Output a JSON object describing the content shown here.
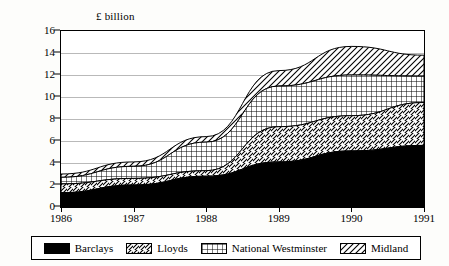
{
  "chart_data": {
    "type": "area",
    "title": "",
    "subtitle": "",
    "xlabel": "",
    "ylabel": "£ billion",
    "stacked": true,
    "grid": true,
    "legend_position": "bottom",
    "x": [
      1986,
      1987,
      1988,
      1989,
      1990,
      1991
    ],
    "categories": [
      "1986",
      "1987",
      "1988",
      "1989",
      "1990",
      "1991"
    ],
    "xtick_labels": [
      "1986",
      "1987",
      "1988",
      "1989",
      "1990",
      "1991"
    ],
    "ytick_labels": [
      "0",
      "2",
      "4",
      "6",
      "8",
      "10",
      "12",
      "14",
      "16"
    ],
    "ytick_values": [
      0,
      2,
      4,
      6,
      8,
      10,
      12,
      14,
      16
    ],
    "xlim": [
      1986,
      1991
    ],
    "ylim": [
      0,
      16
    ],
    "series": [
      {
        "name": "Barclays",
        "pattern": "solid-black",
        "values": [
          1.3,
          2.0,
          2.8,
          4.1,
          5.1,
          5.6
        ]
      },
      {
        "name": "Lloyds",
        "pattern": "diagonal-forward",
        "values": [
          0.8,
          0.6,
          0.5,
          3.2,
          3.2,
          3.9
        ]
      },
      {
        "name": "National Westminster",
        "pattern": "crosshatch-grid",
        "values": [
          0.6,
          1.1,
          2.6,
          3.7,
          3.7,
          2.4
        ]
      },
      {
        "name": "Midland",
        "pattern": "diagonal-back",
        "values": [
          0.3,
          0.4,
          0.5,
          1.4,
          2.6,
          1.9
        ]
      }
    ],
    "cumulative_tops": [
      {
        "name": "Barclays",
        "values": [
          1.3,
          2.0,
          2.8,
          4.1,
          5.1,
          5.6
        ]
      },
      {
        "name": "Lloyds",
        "values": [
          2.1,
          2.6,
          3.3,
          7.3,
          8.3,
          9.5
        ]
      },
      {
        "name": "National Westminster",
        "values": [
          2.7,
          3.7,
          5.9,
          11.0,
          12.0,
          11.9
        ]
      },
      {
        "name": "Midland",
        "values": [
          3.0,
          4.1,
          6.4,
          12.4,
          14.6,
          13.8
        ]
      }
    ]
  },
  "legend": {
    "items": [
      {
        "label": "Barclays"
      },
      {
        "label": "Lloyds"
      },
      {
        "label": "National Westminster"
      },
      {
        "label": "Midland"
      }
    ]
  }
}
